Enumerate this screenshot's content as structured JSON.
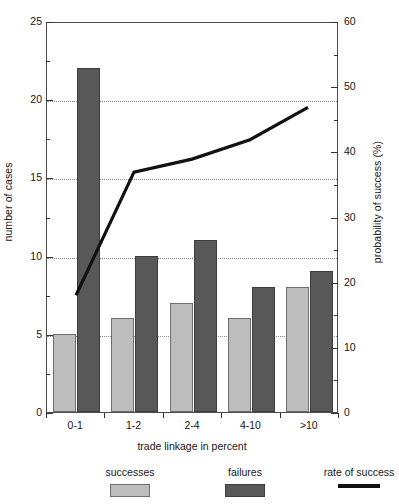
{
  "chart_data": {
    "type": "bar",
    "title": "",
    "subtitle": "",
    "xlabel": "trade linkage in percent",
    "ylabel": "number of cases",
    "y2label": "probability of success (%)",
    "categories": [
      "0-1",
      "1-2",
      "2-4",
      "4-10",
      ">10"
    ],
    "series": [
      {
        "name": "successes",
        "type": "bar",
        "axis": "left",
        "color": "#bdbdbd",
        "values": [
          5,
          6,
          7,
          6,
          8
        ]
      },
      {
        "name": "failures",
        "type": "bar",
        "axis": "left",
        "color": "#585858",
        "values": [
          22,
          10,
          11,
          8,
          9
        ]
      },
      {
        "name": "rate of success",
        "type": "line",
        "axis": "right",
        "color": "#111111",
        "values": [
          18,
          37,
          39,
          42,
          47
        ]
      }
    ],
    "ylim": [
      0,
      25
    ],
    "y2lim": [
      0,
      60
    ],
    "yticks": [
      0,
      5,
      10,
      15,
      20,
      25
    ],
    "y2ticks": [
      0,
      10,
      20,
      30,
      40,
      50,
      60
    ],
    "yminorticks": [
      2.5,
      7.5,
      12.5,
      17.5,
      22.5
    ],
    "y2minorticks": [
      5,
      15,
      25,
      35,
      45,
      55
    ],
    "gridlines": [
      5,
      10,
      15,
      20
    ],
    "grid": true,
    "legend_position": "bottom"
  },
  "axes": {
    "left": {
      "title": "number of cases",
      "ticklabels": [
        "0",
        "5",
        "10",
        "15",
        "20",
        "25"
      ]
    },
    "right": {
      "title": "probability of success (%)",
      "ticklabels": [
        "0",
        "10",
        "20",
        "30",
        "40",
        "50",
        "60"
      ]
    },
    "bottom": {
      "title": "trade linkage in percent",
      "ticklabels": [
        "0-1",
        "1-2",
        "2-4",
        "4-10",
        ">10"
      ]
    }
  },
  "legend": {
    "items": [
      {
        "label": "successes",
        "marker": "swatch-light-gray"
      },
      {
        "label": "failures",
        "marker": "swatch-dark-gray"
      },
      {
        "label": "rate of success",
        "marker": "line-black"
      }
    ]
  }
}
